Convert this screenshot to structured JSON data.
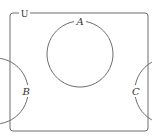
{
  "diagram": {
    "type": "venn",
    "universe": {
      "label": "U",
      "frame": {
        "x": 10,
        "y": 13,
        "width": 138,
        "height": 118,
        "corner_radius": 3
      }
    },
    "sets": [
      {
        "label": "A",
        "cx": 80,
        "cy": 54,
        "r": 33,
        "label_x": 80,
        "label_y": 24
      },
      {
        "label": "B",
        "cx": 60,
        "cy": 91,
        "r": 33,
        "label_x": 26,
        "label_y": 95
      },
      {
        "label": "C",
        "cx": 103,
        "cy": 91,
        "r": 33,
        "label_x": 136,
        "label_y": 95
      }
    ],
    "colors": {
      "stroke": "#6e6e6e",
      "text": "#333333",
      "background": "#ffffff"
    }
  }
}
